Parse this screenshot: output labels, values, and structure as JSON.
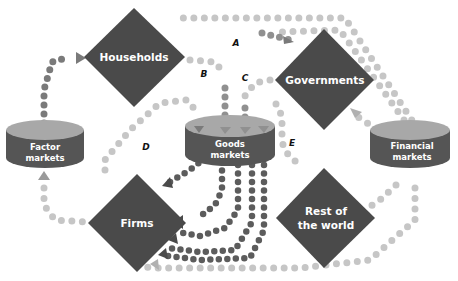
{
  "colors": {
    "node_fill": "#4a4a4a",
    "cyl_top": "#a8a8a8",
    "cyl_side": "#555555",
    "dot_light": "#c4c4c4",
    "dot_mid": "#8e8e8e",
    "dot_dark": "#5a5a5a",
    "label_text": "#ffffff"
  },
  "nodes": {
    "households": "Households",
    "governments": "Governments",
    "firms": "Firms",
    "rest_of_world_line1": "Rest of",
    "rest_of_world_line2": "the world"
  },
  "markets": {
    "factor_line1": "Factor",
    "factor_line2": "markets",
    "goods_line1": "Goods",
    "goods_line2": "markets",
    "financial_line1": "Financial",
    "financial_line2": "markets"
  },
  "flow_labels": {
    "a": "A",
    "b": "B",
    "c": "C",
    "d": "D",
    "e": "E"
  }
}
